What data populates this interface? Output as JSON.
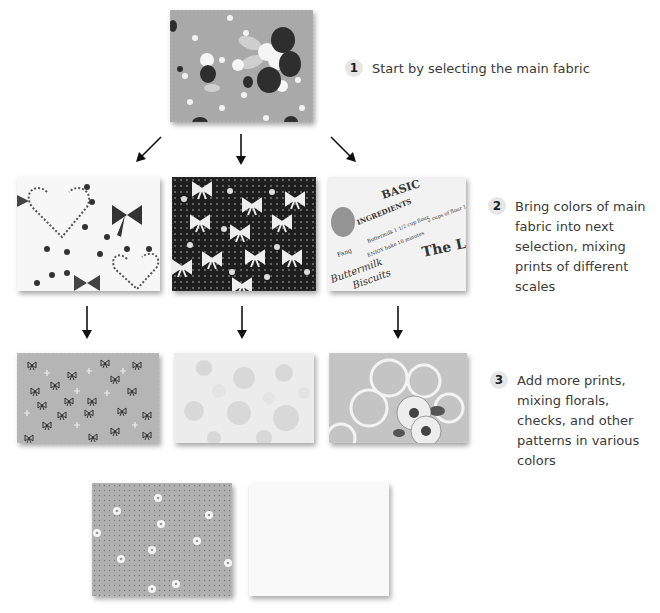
{
  "steps": [
    {
      "number": "1",
      "text": "Start by selecting the main fabric"
    },
    {
      "number": "2",
      "text": "Bring colors of main fabric into next selection, mixing prints of different scales"
    },
    {
      "number": "3",
      "text": "Add more prints, mixing florals, checks, and other patterns in various colors"
    }
  ],
  "swatches": {
    "main": {
      "name": "strawberry-floral-dot",
      "bg": "#a9a9a9"
    },
    "row2": [
      {
        "name": "hearts-bows-white",
        "bg": "#f7f7f7"
      },
      {
        "name": "bows-on-black",
        "bg": "#1e1e1e"
      },
      {
        "name": "newsprint-text",
        "bg": "#f2f2f2"
      }
    ],
    "row3": [
      {
        "name": "tiny-bows-gray",
        "bg": "#b5b5b5"
      },
      {
        "name": "pale-daisies",
        "bg": "#ececec"
      },
      {
        "name": "large-floral-outline",
        "bg": "#c4c4c4"
      }
    ],
    "row4": [
      {
        "name": "pin-dot-daisies",
        "bg": "#b0b0b0"
      },
      {
        "name": "solid-white",
        "bg": "#f9f9f9"
      }
    ]
  },
  "colors": {
    "arrow": "#111111",
    "badge_bg": "#e6e6e6",
    "text": "#3a3a3a"
  }
}
